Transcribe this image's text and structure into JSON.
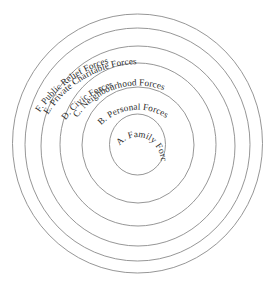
{
  "diagram": {
    "type": "concentric-circles",
    "colors": {
      "background": "#ffffff",
      "ring_stroke": "#8a8a8a",
      "label_text": "#2b2b2b"
    },
    "rings": [
      {
        "id": "A",
        "label": "A. Family Forces",
        "order": 1
      },
      {
        "id": "B",
        "label": "B. Personal Forces",
        "order": 2
      },
      {
        "id": "C",
        "label": "C. Neighbourhood Forces",
        "order": 3
      },
      {
        "id": "D",
        "label": "D. Civic Forces",
        "order": 4
      },
      {
        "id": "E",
        "label": "E. Private Charitable Forces",
        "order": 5
      },
      {
        "id": "F",
        "label": "F. Public Relief Forces",
        "order": 6
      }
    ]
  }
}
